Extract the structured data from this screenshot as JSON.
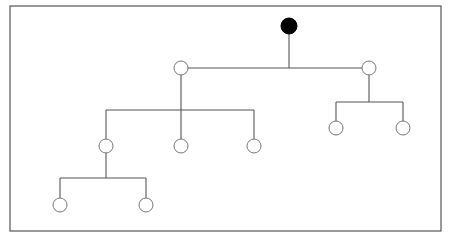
{
  "diagram": {
    "type": "tree",
    "colors": {
      "border": "#555555",
      "edge": "#555555",
      "root_fill": "#000000",
      "node_fill": "#ffffff",
      "node_stroke": "#777777"
    },
    "frame": {
      "x": 10,
      "y": 6,
      "width": 431,
      "height": 225
    },
    "node_radius": 7,
    "root_radius": 8,
    "nodes": [
      {
        "id": "root",
        "x": 289,
        "y": 26,
        "filled": true
      },
      {
        "id": "a",
        "x": 181,
        "y": 68,
        "filled": false
      },
      {
        "id": "b",
        "x": 369,
        "y": 68,
        "filled": false
      },
      {
        "id": "a1",
        "x": 106,
        "y": 146,
        "filled": false
      },
      {
        "id": "a2",
        "x": 181,
        "y": 146,
        "filled": false
      },
      {
        "id": "a3",
        "x": 254,
        "y": 146,
        "filled": false
      },
      {
        "id": "b1",
        "x": 336,
        "y": 128,
        "filled": false
      },
      {
        "id": "b2",
        "x": 403,
        "y": 128,
        "filled": false
      },
      {
        "id": "a1x",
        "x": 60,
        "y": 205,
        "filled": false
      },
      {
        "id": "a1y",
        "x": 146,
        "y": 205,
        "filled": false
      }
    ],
    "edges": [
      {
        "parent": "root",
        "children": [
          "a",
          "b"
        ],
        "bar_y": 68
      },
      {
        "parent": "a",
        "children": [
          "a1",
          "a2",
          "a3"
        ],
        "bar_y": 110
      },
      {
        "parent": "b",
        "children": [
          "b1",
          "b2"
        ],
        "bar_y": 102
      },
      {
        "parent": "a1",
        "children": [
          "a1x",
          "a1y"
        ],
        "bar_y": 178
      }
    ]
  }
}
